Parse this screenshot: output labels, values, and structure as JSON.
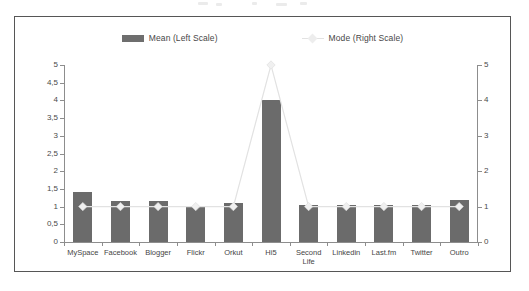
{
  "chart_data": {
    "type": "bar",
    "title": "",
    "subtitle": "",
    "xlabel": "",
    "ylabel": "",
    "grid": false,
    "legend_position": "top-center",
    "categories": [
      "MySpace",
      "Facebook",
      "Blogger",
      "Flickr",
      "Orkut",
      "Hi5",
      "Second\nLife",
      "Linkedin",
      "Last.fm",
      "Twitter",
      "Outro"
    ],
    "series": [
      {
        "name": "Mean (Left Scale)",
        "type": "bar",
        "axis": "left",
        "color": "#6b6b6b",
        "values": [
          1.4,
          1.15,
          1.15,
          1.0,
          1.1,
          4.0,
          1.05,
          1.05,
          1.05,
          1.05,
          1.2
        ]
      },
      {
        "name": "Mode (Right Scale)",
        "type": "line",
        "axis": "right",
        "color": "#e2e2e2",
        "marker": "diamond",
        "values": [
          1,
          1,
          1,
          1,
          1,
          5,
          1,
          1,
          1,
          1,
          1
        ]
      }
    ],
    "left_axis": {
      "min": 0,
      "max": 5,
      "ticks": [
        0,
        0.5,
        1,
        1.5,
        2,
        2.5,
        3,
        3.5,
        4,
        4.5,
        5
      ],
      "tick_labels": [
        "0",
        "0,5",
        "1",
        "1,5",
        "2",
        "2,5",
        "3",
        "3,5",
        "4",
        "4,5",
        "5"
      ]
    },
    "right_axis": {
      "min": 0,
      "max": 5,
      "ticks": [
        0,
        1,
        2,
        3,
        4,
        5
      ],
      "tick_labels": [
        "0",
        "1",
        "2",
        "3",
        "4",
        "5"
      ]
    }
  },
  "legend": {
    "entries": [
      {
        "label": "Mean (Left Scale)"
      },
      {
        "label": "Mode (Right Scale)"
      }
    ]
  },
  "colors": {
    "bar": "#6b6b6b",
    "line": "#e2e2e2",
    "axis": "#8d8d8d",
    "frame": "#565656",
    "text": "#454545",
    "background": "#ffffff"
  }
}
